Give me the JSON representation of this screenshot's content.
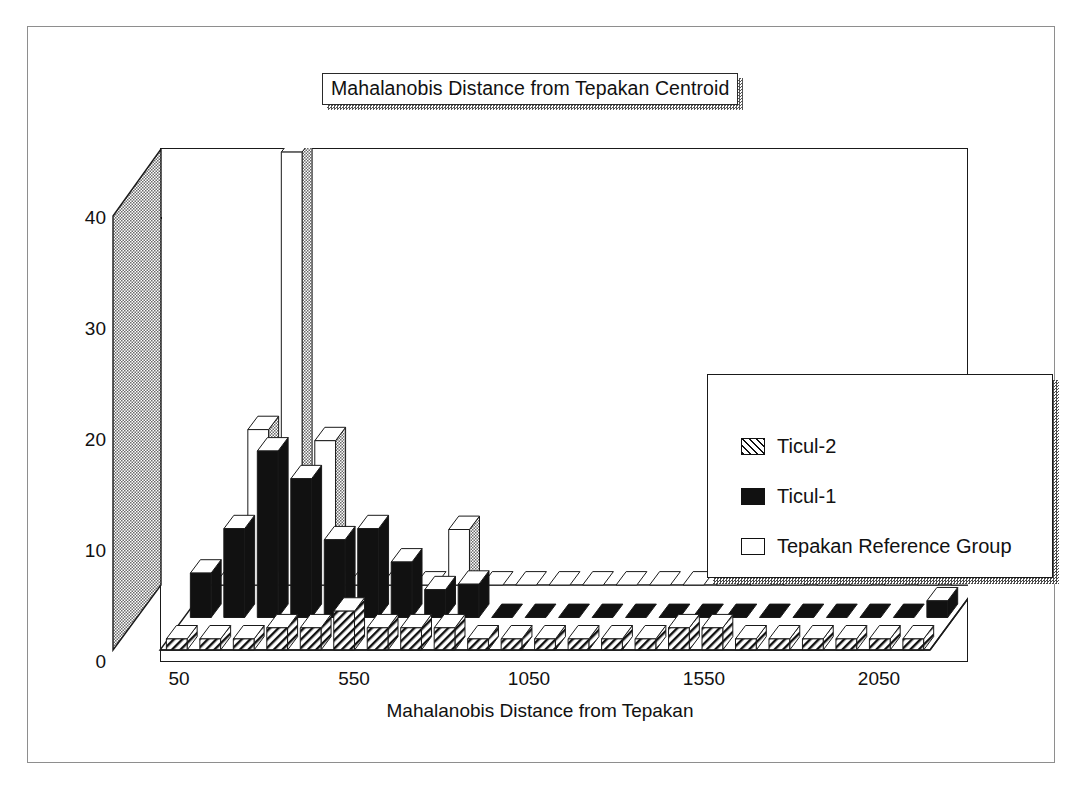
{
  "figure": {
    "title": "Mahalanobis Distance from Tepakan Centroid",
    "frame": true
  },
  "legend": {
    "position": "upper-right",
    "items": [
      {
        "label": "Ticul-2",
        "swatch": "hatched-diagonal",
        "color": "#111111"
      },
      {
        "label": "Ticul-1",
        "swatch": "solid-black",
        "color": "#111111"
      },
      {
        "label": "Tepakan Reference Group",
        "swatch": "open-white",
        "color": "#ffffff"
      }
    ]
  },
  "chart_data": {
    "type": "bar",
    "style": "3d-grouped-histogram",
    "title": "Mahalanobis Distance from Tepakan Centroid",
    "xlabel": "Mahalanobis Distance from Tepakan",
    "ylabel": "Number of Specimens",
    "ylim": [
      0,
      44
    ],
    "yticks": [
      0,
      10,
      20,
      30,
      40
    ],
    "xticks": [
      50,
      550,
      1050,
      1550,
      2050
    ],
    "grid": false,
    "bin_width": 100,
    "bin_centers": [
      50,
      150,
      250,
      350,
      450,
      550,
      650,
      750,
      850,
      950,
      1050,
      1150,
      1250,
      1350,
      1450,
      1550,
      1650,
      1750,
      1850,
      1950,
      2050,
      2150,
      2250
    ],
    "series": [
      {
        "name": "Tepakan Reference Group",
        "fill": "open-white",
        "values": [
          0,
          14,
          39,
          13,
          0,
          0,
          0,
          5,
          0,
          0,
          0,
          0,
          0,
          0,
          0,
          0,
          0,
          0,
          0,
          0,
          0,
          0,
          0
        ]
      },
      {
        "name": "Ticul-1",
        "fill": "solid-black",
        "values": [
          4,
          8,
          15,
          12.5,
          7,
          8,
          5,
          2.5,
          3,
          0,
          0,
          0,
          0,
          0,
          0,
          0,
          0,
          0,
          0,
          0,
          0,
          0,
          1.5
        ]
      },
      {
        "name": "Ticul-2",
        "fill": "hatched-diagonal",
        "values": [
          1,
          1,
          1,
          2,
          2,
          3.5,
          2,
          2,
          2,
          1,
          1,
          1,
          1,
          1,
          1,
          2,
          2,
          1,
          1,
          1,
          1,
          1,
          1
        ]
      }
    ]
  },
  "axes": {
    "y_ticks": [
      "0",
      "10",
      "20",
      "30",
      "40"
    ],
    "x_ticks": [
      "50",
      "550",
      "1050",
      "1550",
      "2050"
    ],
    "y_title": "Number of Specimens",
    "x_title": "Mahalanobis Distance from Tepakan"
  }
}
